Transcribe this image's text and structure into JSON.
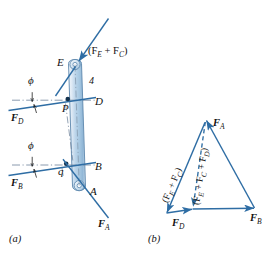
{
  "figure": {
    "colors": {
      "line": "#2e6da4",
      "line_dark": "#1f5party",
      "stroke": "#30699f",
      "bar_light": "#e8f0f8",
      "bar_mid": "#b9d2e8",
      "bar_dark": "#8fb4d6",
      "center_line": "#6b7f96",
      "text": "#111111"
    }
  },
  "panel_a": {
    "caption": "(a)",
    "points": {
      "E": "E",
      "D": "D",
      "B": "B",
      "A": "A",
      "P": "P",
      "q": "q"
    },
    "member_number": "4",
    "angles": {
      "phi_upper": "ϕ",
      "phi_lower": "ϕ"
    },
    "forces": {
      "top": {
        "text": "(F",
        "sub1": "E",
        "plus": " + F",
        "sub2": "C",
        "close": ")"
      },
      "fd": {
        "text": "F",
        "sub": "D"
      },
      "fb": {
        "text": "F",
        "sub": "B"
      },
      "fa": {
        "text": "F",
        "sub": "A"
      }
    }
  },
  "panel_b": {
    "caption": "(b)",
    "vectors": {
      "fa": {
        "text": "F",
        "sub": "A"
      },
      "fb": {
        "text": "F",
        "sub": "B"
      },
      "fd": {
        "text": "F",
        "sub": "D"
      },
      "ec": "(F_E + F_C)",
      "ecd": "(F_E + F_C + F_D)"
    },
    "ec_parts": {
      "open": "(F",
      "s1": "E",
      "p1": " + F",
      "s2": "C",
      "close": ")"
    },
    "ecd_parts": {
      "open": "(F",
      "s1": "E",
      "p1": " + F",
      "s2": "C",
      "p2": " + F",
      "s3": "D",
      "close": ")"
    }
  }
}
